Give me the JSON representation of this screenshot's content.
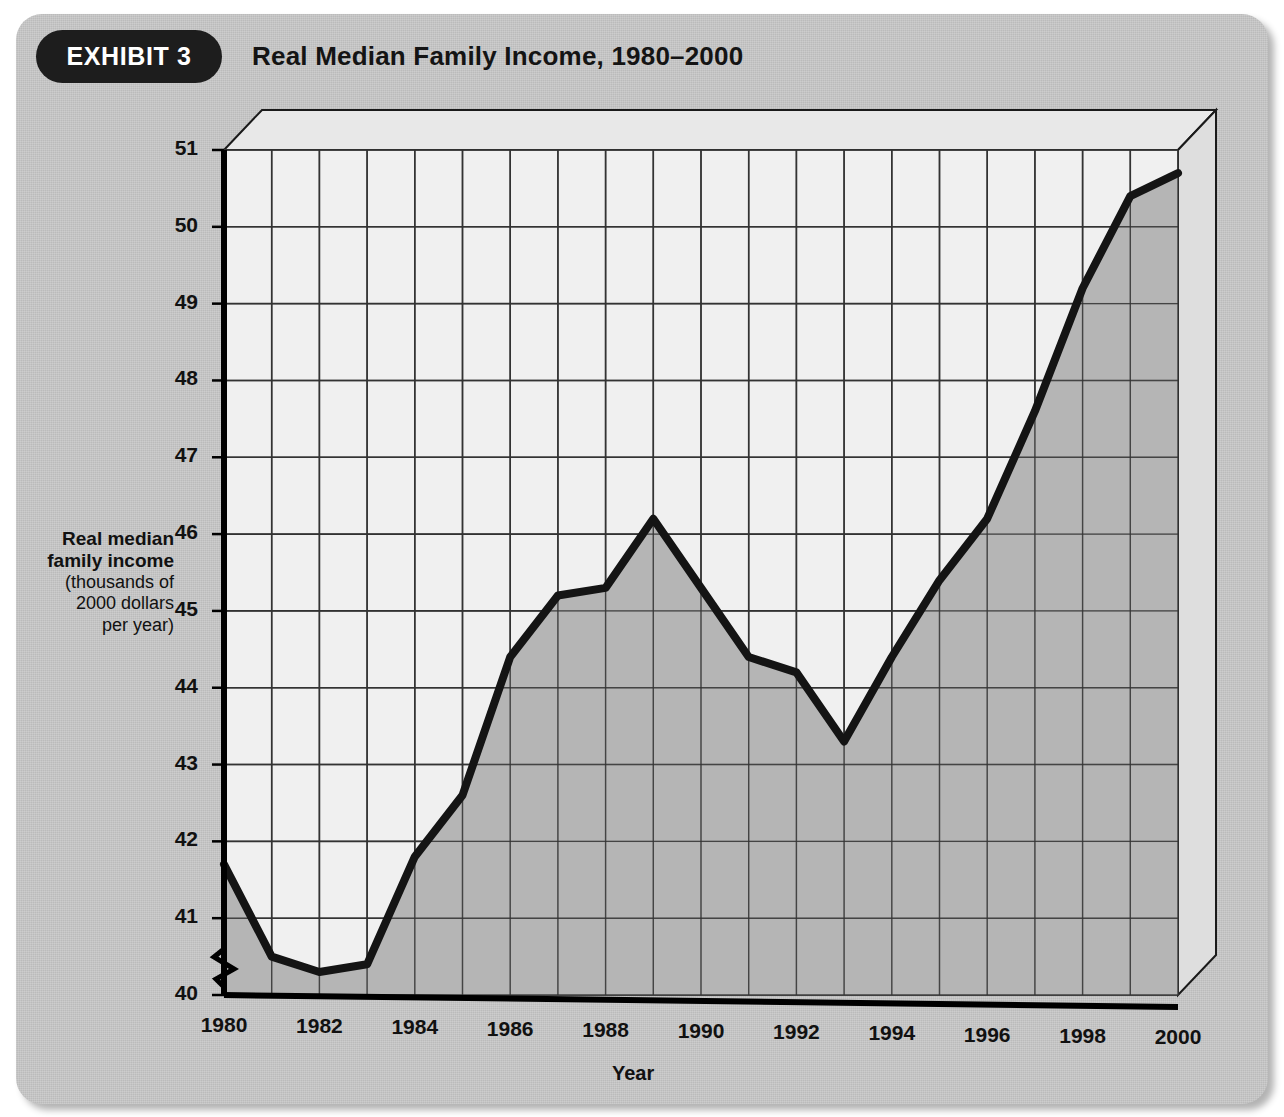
{
  "exhibit": {
    "badge_label": "EXHIBIT 3",
    "title": "Real Median Family Income, 1980–2000"
  },
  "axis_labels": {
    "y_line1": "Real median",
    "y_line2": "family income",
    "y_line3": "(thousands of",
    "y_line4": "2000 dollars",
    "y_line5": "per year)",
    "x_title": "Year"
  },
  "colors": {
    "card_background": "#c9c9c9",
    "badge_background": "#1d1d1d",
    "badge_text": "#ffffff",
    "plot_background": "#f0f0f0",
    "area_fill": "#b0b0b0",
    "line": "#141414",
    "grid": "#333333",
    "axis": "#000000",
    "depth_face": "#e8e8e8"
  },
  "chart_data": {
    "type": "line",
    "title": "Real Median Family Income, 1980–2000",
    "xlabel": "Year",
    "ylabel": "Real median family income (thousands of 2000 dollars per year)",
    "xlim": [
      1980,
      2000
    ],
    "ylim": [
      40,
      51
    ],
    "y_axis_break": true,
    "grid": true,
    "legend": "none",
    "area_filled": true,
    "y_ticks": [
      40,
      41,
      42,
      43,
      44,
      45,
      46,
      47,
      48,
      49,
      50,
      51
    ],
    "x_ticks": [
      1980,
      1982,
      1984,
      1986,
      1988,
      1990,
      1992,
      1994,
      1996,
      1998,
      2000
    ],
    "x_tick_labels": [
      "1980",
      "1982",
      "1984",
      "1986",
      "1988",
      "1990",
      "1992",
      "1994",
      "1996",
      "1998",
      "2000"
    ],
    "y_tick_labels": [
      "40",
      "41",
      "42",
      "43",
      "44",
      "45",
      "46",
      "47",
      "48",
      "49",
      "50",
      "51"
    ],
    "x": [
      1980,
      1981,
      1982,
      1983,
      1984,
      1985,
      1986,
      1987,
      1988,
      1989,
      1990,
      1991,
      1992,
      1993,
      1994,
      1995,
      1996,
      1997,
      1998,
      1999,
      2000
    ],
    "values": [
      41.7,
      40.5,
      40.3,
      40.4,
      41.8,
      42.6,
      44.4,
      45.2,
      45.3,
      46.2,
      45.3,
      44.4,
      44.2,
      43.3,
      44.4,
      45.4,
      46.2,
      47.6,
      49.2,
      50.4,
      50.7
    ],
    "series": [
      {
        "name": "Real median family income",
        "values": [
          41.7,
          40.5,
          40.3,
          40.4,
          41.8,
          42.6,
          44.4,
          45.2,
          45.3,
          46.2,
          45.3,
          44.4,
          44.2,
          43.3,
          44.4,
          45.4,
          46.2,
          47.6,
          49.2,
          50.4,
          50.7
        ]
      }
    ]
  }
}
